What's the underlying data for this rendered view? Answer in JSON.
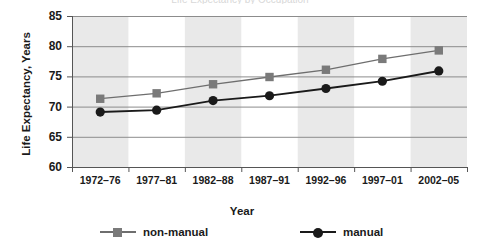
{
  "figure": {
    "clipped_title": "Life Expectancy by Occupation",
    "width": 484,
    "height": 248
  },
  "chart_data": {
    "type": "line",
    "title": "",
    "xlabel": "Year",
    "ylabel": "Life Expectancy, Years",
    "categories": [
      "1972–76",
      "1977–81",
      "1982–88",
      "1987–91",
      "1992–96",
      "1997–01",
      "2002–05"
    ],
    "ylim": [
      60,
      85
    ],
    "yticks": [
      60,
      65,
      70,
      75,
      80,
      85
    ],
    "ytick_labels": [
      "60",
      "65",
      "70",
      "75",
      "80",
      "85"
    ],
    "grid": "horizontal",
    "banding": "alternating vertical shaded bands",
    "legend_position": "bottom",
    "series": [
      {
        "name": "non-manual",
        "marker": "square",
        "color": "#7a7a7a",
        "line_color": "#6e6e6e",
        "values": [
          71.3,
          72.2,
          73.7,
          74.9,
          76.1,
          77.9,
          79.3
        ]
      },
      {
        "name": "manual",
        "marker": "circle",
        "color": "#1a1a1a",
        "line_color": "#1a1a1a",
        "values": [
          69.1,
          69.4,
          71.0,
          71.8,
          73.0,
          74.2,
          75.9
        ]
      }
    ]
  },
  "style": {
    "band_color": "#e9e9e9",
    "plot_background": "#ffffff",
    "grid_color": "#8c8c8c",
    "axis_color": "#555555"
  },
  "axes_geometry": {
    "plot_left": 72,
    "plot_right": 467,
    "plot_top": 16,
    "plot_bottom": 167
  }
}
